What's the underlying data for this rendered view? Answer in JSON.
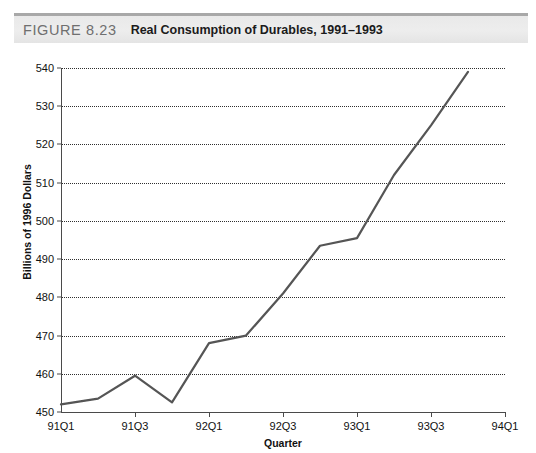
{
  "figure": {
    "label": "FIGURE 8.23",
    "title": "Real Consumption of Durables, 1991–1993"
  },
  "chart_data": {
    "type": "line",
    "title": "Real Consumption of Durables, 1991–1993",
    "xlabel": "Quarter",
    "ylabel": "Billions of 1996 Dollars",
    "x": [
      "91Q1",
      "91Q2",
      "91Q3",
      "91Q4",
      "92Q1",
      "92Q2",
      "92Q3",
      "92Q4",
      "93Q1",
      "93Q2",
      "93Q3",
      "93Q4"
    ],
    "values": [
      452,
      453.5,
      459.5,
      452.5,
      468,
      470,
      481,
      493.5,
      495.5,
      512,
      525,
      539
    ],
    "ylim": [
      450,
      540
    ],
    "yticks": [
      450,
      460,
      470,
      480,
      490,
      500,
      510,
      520,
      530,
      540
    ],
    "xticks": [
      "91Q1",
      "91Q3",
      "92Q1",
      "92Q3",
      "93Q1",
      "93Q3",
      "94Q1"
    ],
    "xlim": [
      "91Q1",
      "94Q1"
    ],
    "grid": "horizontal-dotted",
    "legend": "none",
    "series_color": "#555555",
    "gridline_color": "#2f2f2f",
    "axis_color": "#4a4a4a"
  }
}
